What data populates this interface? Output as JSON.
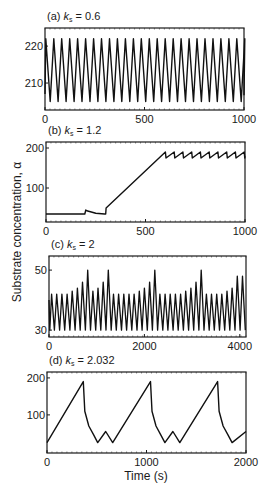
{
  "figure": {
    "ylabel": "Substrate concentration, α",
    "xlabel": "Time (s)"
  },
  "chart_data": [
    {
      "type": "line",
      "panel": "a",
      "title_prefix": "(a) ",
      "title_var": "k",
      "title_sub": "s",
      "title_value": " = 0.6",
      "xlim": [
        0,
        1000
      ],
      "ylim": [
        202.7,
        224.9
      ],
      "xticks": [
        0,
        500,
        1000
      ],
      "yticks": [
        210,
        220
      ],
      "description": "Regular sawtooth oscillation, ~25 cycles, between ~205 and ~222",
      "series": [
        {
          "name": "alpha",
          "pattern": "sawtooth",
          "period": 40,
          "min": 205,
          "max": 222,
          "start": 207
        }
      ]
    },
    {
      "type": "line",
      "panel": "b",
      "title_prefix": "(b) ",
      "title_var": "k",
      "title_sub": "s",
      "title_value": " = 1.2",
      "xlim": [
        0,
        1000
      ],
      "ylim": [
        15,
        215
      ],
      "xticks": [
        0,
        500,
        1000
      ],
      "yticks": [
        100,
        200
      ],
      "description": "Flat ~35, small bump at t≈200, jump at t≈300, linear rise to ~190 at t≈600, then small sawtooth 175–190",
      "series": [
        {
          "name": "alpha",
          "x": [
            0,
            195,
            200,
            205,
            250,
            295,
            300,
            302,
            600
          ],
          "y": [
            35,
            35,
            45,
            43,
            37,
            35,
            35,
            50,
            190
          ]
        }
      ],
      "tail": {
        "pattern": "sawtooth",
        "from": 600,
        "to": 1000,
        "period": 44,
        "min": 175,
        "max": 190
      }
    },
    {
      "type": "line",
      "panel": "c",
      "title_prefix": "(c) ",
      "title_var": "k",
      "title_sub": "s",
      "title_value": " = 2",
      "xlim": [
        0,
        4130
      ],
      "ylim": [
        27.7,
        54.7
      ],
      "xticks": [
        0,
        2000,
        4000
      ],
      "yticks": [
        30,
        50
      ],
      "description": "Bursting oscillation, ~37 spikes; base peaks ~42 with periodic growth up to ~50",
      "series": [
        {
          "name": "peaks",
          "trough": 30,
          "values": [
            42,
            42,
            42,
            42,
            43,
            44,
            46,
            50,
            43,
            44,
            46,
            50,
            42,
            42,
            42,
            42,
            42,
            43,
            44,
            46,
            50,
            42,
            42,
            42,
            42,
            42,
            43,
            44,
            46,
            50,
            42,
            42,
            42,
            42,
            43,
            44,
            48,
            48
          ]
        }
      ]
    },
    {
      "type": "line",
      "panel": "d",
      "title_prefix": "(d) ",
      "title_var": "k",
      "title_sub": "s",
      "title_value": " = 2.032",
      "xlim": [
        0,
        2000
      ],
      "ylim": [
        -3,
        216
      ],
      "xticks": [
        0,
        1000,
        2000
      ],
      "yticks": [
        100,
        200
      ],
      "description": "Relaxation oscillation, period ~690 s: linear rise to ~190, fast decay to ~25, small bump to ~55",
      "series": [
        {
          "name": "alpha",
          "x": [
            0,
            365,
            380,
            420,
            470,
            510,
            590,
            660,
            1040,
            1055,
            1095,
            1145,
            1185,
            1265,
            1335,
            1715,
            1730,
            1770,
            1820,
            1860,
            2000
          ],
          "y": [
            25,
            190,
            110,
            70,
            45,
            25,
            55,
            25,
            190,
            110,
            70,
            45,
            25,
            55,
            25,
            190,
            110,
            70,
            45,
            25,
            55
          ]
        }
      ]
    }
  ]
}
